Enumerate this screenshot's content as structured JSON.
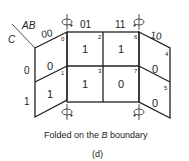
{
  "diagram": {
    "axis_labels": {
      "row_var": "AB",
      "col_var": "C"
    },
    "column_headers": [
      "00",
      "01",
      "11",
      "10"
    ],
    "row_headers": [
      "0",
      "1"
    ],
    "cells": [
      {
        "minterm": "0",
        "value": "0"
      },
      {
        "minterm": "2",
        "value": "1"
      },
      {
        "minterm": "6",
        "value": "1"
      },
      {
        "minterm": "4",
        "value": "0"
      },
      {
        "minterm": "1",
        "value": "1"
      },
      {
        "minterm": "3",
        "value": "1"
      },
      {
        "minterm": "7",
        "value": "0"
      },
      {
        "minterm": "5",
        "value": "0"
      }
    ],
    "caption_prefix": "Folded on the ",
    "caption_var": "B",
    "caption_suffix": " boundary",
    "sublabel": "(d)"
  }
}
